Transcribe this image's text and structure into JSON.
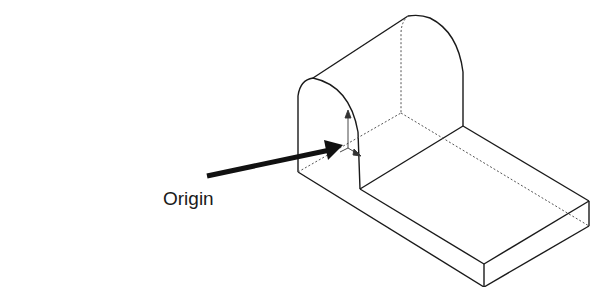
{
  "figure": {
    "type": "isometric-part-sketch",
    "annotation": {
      "label": "Origin",
      "pointer": "arrow-to-origin"
    },
    "colors": {
      "stroke": "#1a1a1a",
      "hidden_line": "#555555",
      "background": "#ffffff"
    }
  }
}
